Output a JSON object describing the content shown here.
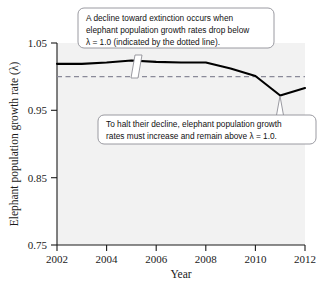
{
  "figure": {
    "background_color": "#ffffff",
    "plot_background_color": "#f2f2f2",
    "line_color": "#000000",
    "threshold_color": "#8a8a99",
    "callout_border_color": "#8f8f96"
  },
  "chart_data": {
    "type": "line",
    "title": "",
    "xlabel": "Year",
    "ylabel": "Elephant population growth rate (λ)",
    "xlim": [
      2002,
      2012
    ],
    "ylim": [
      0.75,
      1.05
    ],
    "xticks": [
      2002,
      2004,
      2006,
      2008,
      2010,
      2012
    ],
    "xticklabels": [
      "2002",
      "2004",
      "2006",
      "2008",
      "2010",
      "2012"
    ],
    "yticks": [
      0.75,
      0.85,
      0.95,
      1.05
    ],
    "yticklabels": [
      "0.75",
      "0.85",
      "0.95",
      "1.05"
    ],
    "grid": false,
    "legend": "none",
    "x": [
      2002,
      2003,
      2004,
      2005,
      2006,
      2007,
      2008,
      2009,
      2010,
      2011,
      2012
    ],
    "series": [
      {
        "name": "Elephant population growth rate",
        "values": [
          1.019,
          1.019,
          1.021,
          1.024,
          1.022,
          1.021,
          1.021,
          1.012,
          1.001,
          0.972,
          0.983
        ]
      }
    ],
    "threshold_line": {
      "value": 1.0,
      "label": "λ = 1.0",
      "style": "dashed"
    }
  },
  "annotations": [
    {
      "id": "callout-decline",
      "lines": [
        "A decline toward extinction occurs when",
        "elephant population growth rates drop below",
        "λ = 1.0 (indicated by the dotted line)."
      ],
      "points_to_year": 2005
    },
    {
      "id": "callout-halt",
      "lines": [
        "To halt their decline, elephant population growth",
        "rates must increase and remain above λ = 1.0."
      ],
      "points_to_year": 2011
    }
  ],
  "caption": {
    "text": "Figure caption text partially visible at the bottom edge of the image."
  }
}
